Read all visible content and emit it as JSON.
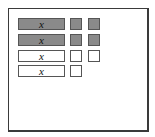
{
  "diagram": {
    "type": "algebra-tiles",
    "colors": {
      "shaded": "#8a8a8a",
      "plain": "#ffffff",
      "border": "#444444"
    },
    "rows": [
      {
        "x_tile": {
          "label": "x",
          "shaded": true
        },
        "unit_tiles": [
          {
            "shaded": true
          },
          {
            "shaded": true
          }
        ]
      },
      {
        "x_tile": {
          "label": "x",
          "shaded": true
        },
        "unit_tiles": [
          {
            "shaded": true
          },
          {
            "shaded": true
          }
        ]
      },
      {
        "x_tile": {
          "label": "x",
          "shaded": false
        },
        "unit_tiles": [
          {
            "shaded": false
          },
          {
            "shaded": false
          }
        ]
      },
      {
        "x_tile": {
          "label": "x",
          "shaded": false
        },
        "unit_tiles": [
          {
            "shaded": false
          }
        ]
      }
    ]
  }
}
